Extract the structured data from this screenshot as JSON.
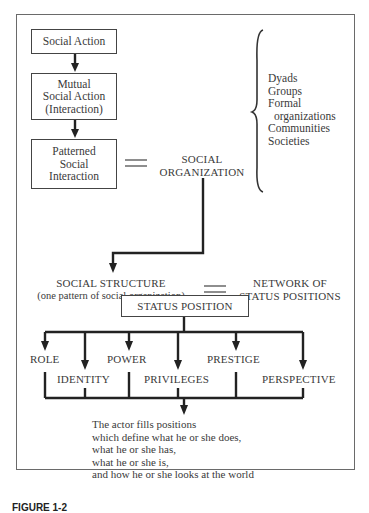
{
  "diagram": {
    "flow": {
      "social_action": "Social Action",
      "mutual_social_action": [
        "Mutual",
        "Social Action",
        "(Interaction)"
      ],
      "patterned_social_interaction": [
        "Patterned",
        "Social",
        "Interaction"
      ]
    },
    "equals_sign": "=",
    "social_organization": [
      "SOCIAL",
      "ORGANIZATION"
    ],
    "organization_types": [
      "Dyads",
      "Groups",
      "Formal",
      "organizations",
      "Communities",
      "Societies"
    ],
    "social_structure": {
      "title": "SOCIAL STRUCTURE",
      "subtitle": "(one pattern of social organization)"
    },
    "network": [
      "NETWORK OF",
      "STATUS POSITIONS"
    ],
    "status_position": "STATUS POSITION",
    "components": {
      "role": "ROLE",
      "identity": "IDENTITY",
      "power": "POWER",
      "privileges": "PRIVILEGES",
      "prestige": "PRESTIGE",
      "perspective": "PERSPECTIVE"
    },
    "conclusion": [
      "The actor fills positions",
      "which define what he or she does,",
      "what he or she has,",
      "what he or she is,",
      "and how he or she looks at the world"
    ]
  },
  "caption": "FIGURE 1-2"
}
